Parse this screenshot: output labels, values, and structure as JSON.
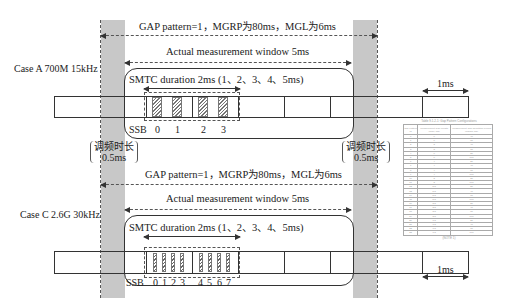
{
  "diagram": {
    "colors": {
      "gap_shading": "#c8c8c8",
      "line": "#333333",
      "hatch": "#777777"
    },
    "retune": {
      "label_line1": "调频时长",
      "label_line2": "0.5ms"
    },
    "case_a": {
      "label": "Case A 700M 15kHz",
      "gap_label": "GAP pattern=1，MGRP为80ms，MGL为6ms",
      "actual_window_label": "Actual measurement window 5ms",
      "smtc_label": "SMTC duration 2ms (1、2、3、4、5ms)",
      "ssb_label": "SSB",
      "ssb_indices": [
        "0",
        "1",
        "2",
        "3"
      ],
      "unit_label": "1ms"
    },
    "case_c": {
      "label": "Case C 2.6G 30kHz",
      "gap_label": "GAP pattern=1，MGRP为80ms，MGL为6ms",
      "actual_window_label": "Actual measurement window 5ms",
      "smtc_label": "SMTC duration 2ms (1、2、3、4、5ms)",
      "ssb_label": "SSB",
      "ssb_indices": [
        "0",
        "1",
        "2",
        "3",
        "4",
        "5",
        "6",
        "7"
      ],
      "unit_label": "1ms"
    },
    "gap_table": {
      "caption": "Table 9.1.2-1: Gap Pattern Configurations",
      "headers": [
        "Gap Pattern Id",
        "Measurement Gap Length (MGL, ms)",
        "Measurement Gap Repetition Period (MGRP, ms)"
      ],
      "rows": [
        [
          "0",
          "6",
          "40"
        ],
        [
          "1",
          "6",
          "80"
        ],
        [
          "2",
          "3",
          "40"
        ],
        [
          "3",
          "3",
          "80"
        ],
        [
          "4",
          "6",
          "20"
        ],
        [
          "5",
          "6",
          "160"
        ],
        [
          "6",
          "4",
          "20"
        ],
        [
          "7",
          "4",
          "40"
        ],
        [
          "8",
          "4",
          "80"
        ],
        [
          "9",
          "4",
          "160"
        ],
        [
          "10",
          "3",
          "20"
        ],
        [
          "11",
          "3",
          "160"
        ],
        [
          "12",
          "5.5",
          "20"
        ],
        [
          "13",
          "5.5",
          "40"
        ],
        [
          "14",
          "5.5",
          "80"
        ],
        [
          "15",
          "5.5",
          "160"
        ],
        [
          "16",
          "3.5",
          "20"
        ],
        [
          "17",
          "3.5",
          "40"
        ],
        [
          "18",
          "3.5",
          "80"
        ],
        [
          "19",
          "3.5",
          "160"
        ],
        [
          "20",
          "1.5",
          "20"
        ],
        [
          "21",
          "1.5",
          "40"
        ],
        [
          "22",
          "1.5",
          "80"
        ],
        [
          "23",
          "1.5",
          "160"
        ]
      ],
      "footer": "(NOTE 1)"
    }
  }
}
